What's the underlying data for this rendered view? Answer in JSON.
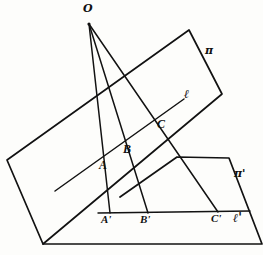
{
  "figure": {
    "background_color": "#fdfdfb",
    "ink_color": "#121212"
  },
  "labels": {
    "center": "O",
    "plane_top": "π",
    "plane_bottom": "π'",
    "line_top": "ℓ",
    "line_bottom": "ℓ'",
    "point_a": "A",
    "point_b": "B",
    "point_c": "C",
    "point_a_prime": "A'",
    "point_b_prime": "B'",
    "point_c_prime": "C'"
  },
  "geometry": {
    "center_point": {
      "x": 89,
      "y": 24
    },
    "plane_pi": {
      "name": "π",
      "corners": [
        {
          "x": 7,
          "y": 160
        },
        {
          "x": 189,
          "y": 30
        },
        {
          "x": 222,
          "y": 94
        },
        {
          "x": 43,
          "y": 244
        }
      ]
    },
    "plane_pi_prime": {
      "name": "π'",
      "corners": [
        {
          "x": 120,
          "y": 197
        },
        {
          "x": 177,
          "y": 157
        },
        {
          "x": 229,
          "y": 158
        },
        {
          "x": 262,
          "y": 244
        },
        {
          "x": 43,
          "y": 244
        }
      ]
    },
    "line_l": {
      "name": "ℓ",
      "start": {
        "x": 55,
        "y": 191
      },
      "end": {
        "x": 184,
        "y": 99
      }
    },
    "line_l_prime": {
      "name": "ℓ'",
      "start": {
        "x": 98,
        "y": 213
      },
      "end": {
        "x": 250,
        "y": 211
      }
    },
    "points": [
      {
        "id": "A",
        "x": 102,
        "y": 157
      },
      {
        "id": "B",
        "x": 125,
        "y": 141
      },
      {
        "id": "C",
        "x": 160,
        "y": 116
      },
      {
        "id": "A'",
        "x": 110,
        "y": 213
      },
      {
        "id": "B'",
        "x": 148,
        "y": 213
      },
      {
        "id": "C'",
        "x": 218,
        "y": 212
      }
    ],
    "rays_from_center": [
      {
        "from": "O",
        "to": "A'"
      },
      {
        "from": "O",
        "to": "B'"
      },
      {
        "from": "O",
        "to": "C'"
      }
    ],
    "projector_segments": [
      {
        "from": "A",
        "to": "A'"
      },
      {
        "from": "B",
        "to": "B'"
      },
      {
        "from": "C",
        "to": "C'"
      }
    ]
  },
  "label_positions": {
    "center": {
      "x": 83,
      "y": 4
    },
    "plane_top": {
      "x": 205,
      "y": 45
    },
    "plane_bottom": {
      "x": 235,
      "y": 168
    },
    "line_top": {
      "x": 184,
      "y": 88
    },
    "line_bottom": {
      "x": 233,
      "y": 215
    },
    "point_a": {
      "x": 99,
      "y": 160
    },
    "point_b": {
      "x": 123,
      "y": 144
    },
    "point_c": {
      "x": 157,
      "y": 119
    },
    "point_a_prime": {
      "x": 101,
      "y": 216
    },
    "point_b_prime": {
      "x": 140,
      "y": 216
    },
    "point_c_prime": {
      "x": 211,
      "y": 215
    }
  }
}
